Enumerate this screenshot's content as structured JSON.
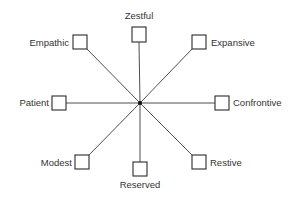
{
  "diagram": {
    "type": "radial-star",
    "nodes": [
      {
        "id": "zestful",
        "label": "Zestful",
        "direction": "north"
      },
      {
        "id": "expansive",
        "label": "Expansive",
        "direction": "north-east"
      },
      {
        "id": "confrontive",
        "label": "Confrontive",
        "direction": "east"
      },
      {
        "id": "restive",
        "label": "Restive",
        "direction": "south-east"
      },
      {
        "id": "reserved",
        "label": "Reserved",
        "direction": "south"
      },
      {
        "id": "modest",
        "label": "Modest",
        "direction": "south-west"
      },
      {
        "id": "patient",
        "label": "Patient",
        "direction": "west"
      },
      {
        "id": "empathic",
        "label": "Empathic",
        "direction": "north-west"
      }
    ]
  }
}
